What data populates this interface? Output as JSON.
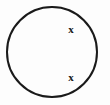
{
  "figure": {
    "name": "circle-with-two-marked-points",
    "background_color": "#fdfdfd",
    "stroke_color": "#1a1a1a",
    "shape": {
      "type": "circle",
      "icon": "circle-outline-icon",
      "center_x": 52,
      "center_y": 52,
      "radius": 45,
      "stroke_width": 2
    },
    "labels": [
      {
        "id": "upper",
        "text": "x",
        "x": 71,
        "y": 29,
        "color": "#1a1a1a"
      },
      {
        "id": "lower",
        "text": "x",
        "x": 71,
        "y": 77,
        "color": "#1a1a1a"
      }
    ]
  },
  "chart_data": {
    "type": "scatter",
    "title": "",
    "xlabel": "",
    "ylabel": "",
    "grid": false,
    "legend": "none",
    "annotations": [
      "x",
      "x"
    ],
    "points": [
      {
        "label": "x",
        "x": 71,
        "y": 29
      },
      {
        "label": "x",
        "x": 71,
        "y": 77
      }
    ],
    "shapes": [
      {
        "type": "circle",
        "cx": 52,
        "cy": 52,
        "r": 45,
        "fill": "none",
        "stroke": "#1a1a1a"
      }
    ]
  }
}
